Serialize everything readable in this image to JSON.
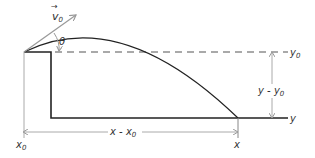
{
  "diagram": {
    "labels": {
      "velocity": "v",
      "velocity_sub": "0",
      "angle": "θ",
      "y0": "y",
      "y0_sub": "0",
      "y": "y",
      "height_diff": "y - y",
      "height_diff_sub": "0",
      "x0": "x",
      "x0_sub": "0",
      "x": "x",
      "range": "x - x",
      "range_sub": "0"
    },
    "colors": {
      "line": "#222222",
      "dimension": "#aaaaaa",
      "text": "#333333"
    }
  }
}
